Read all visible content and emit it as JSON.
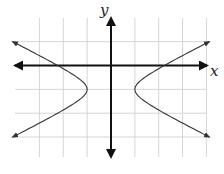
{
  "figure": {
    "type": "coordinate-graph",
    "x_axis_label": "x",
    "y_axis_label": "y",
    "grid": {
      "x_min": -3,
      "x_max": 4,
      "unit_px": 23.85,
      "origin_px": [
        111,
        65.5
      ],
      "vertical_lines_units": [
        -3,
        -2,
        -1,
        0,
        1,
        2,
        3,
        4
      ],
      "horizontal_lines_units": [
        1,
        0,
        -1,
        -2,
        -3
      ],
      "color": "#d6d6d6"
    },
    "curve": {
      "kind": "hyperbola",
      "equation": "x^2 - 4(y+1)^2 = 1",
      "center": [
        0,
        -1
      ],
      "a": 1,
      "b": 0.5,
      "vertices": [
        [
          -1,
          -1
        ],
        [
          1,
          -1
        ]
      ],
      "branch_y_range": [
        -3,
        1
      ],
      "arrowheads_on_ends": true,
      "color": "#333333"
    },
    "axes": {
      "color": "#111111",
      "x_axis_arrow_left_px": 15,
      "x_axis_arrow_right_px": 207,
      "y_axis_arrow_top_px": 18,
      "y_axis_arrow_bottom_px": 157
    }
  }
}
